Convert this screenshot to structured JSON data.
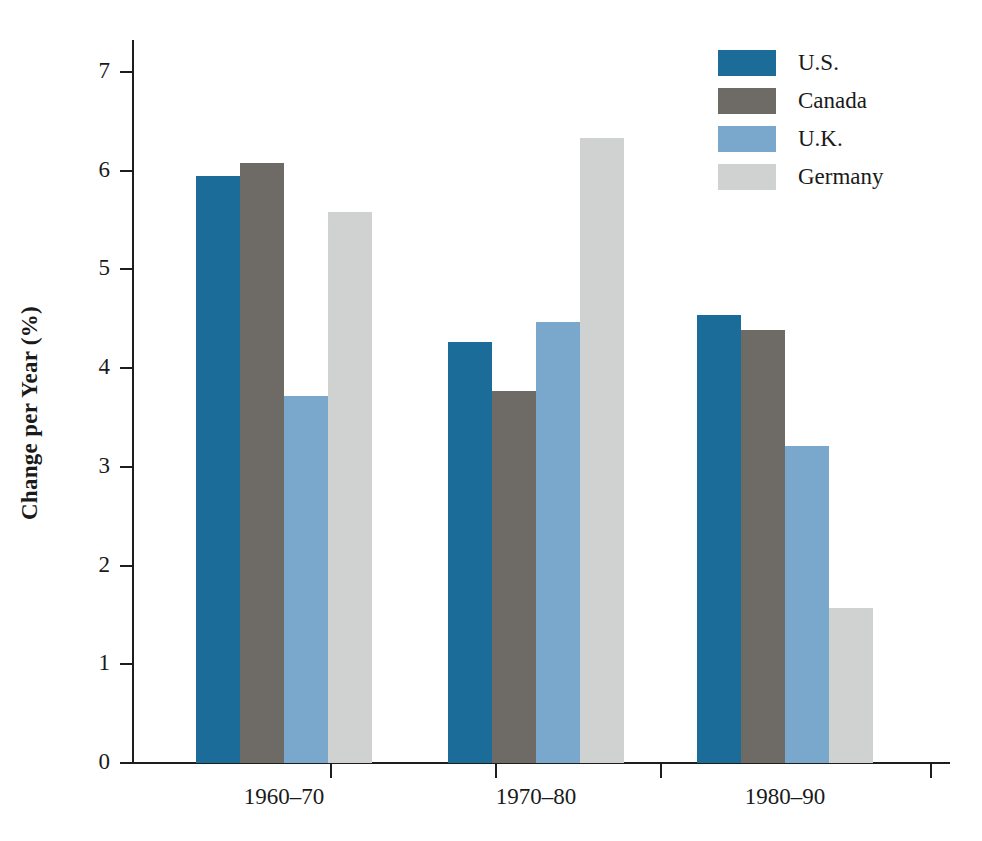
{
  "chart_data": {
    "type": "bar",
    "title": "",
    "xlabel": "",
    "ylabel": "Change per Year (%)",
    "categories": [
      "1960–70",
      "1970–80",
      "1980–90"
    ],
    "series": [
      {
        "name": "U.S.",
        "color": "#1b6c99",
        "values": [
          5.95,
          4.26,
          4.54
        ]
      },
      {
        "name": "Canada",
        "color": "#6e6a66",
        "values": [
          6.08,
          3.77,
          4.39
        ]
      },
      {
        "name": "U.K.",
        "color": "#7aa8cc",
        "values": [
          3.72,
          4.47,
          3.21
        ]
      },
      {
        "name": "Germany",
        "color": "#cfd2d1",
        "values": [
          5.58,
          6.33,
          1.57
        ]
      }
    ],
    "ylim": [
      0,
      7
    ],
    "ytick_labels": [
      "0",
      "1",
      "2",
      "3",
      "4",
      "5",
      "6",
      "7"
    ],
    "ytick_values": [
      0,
      1,
      2,
      3,
      4,
      5,
      6,
      7
    ],
    "grid": false,
    "legend_position": "top-right",
    "annotations": []
  },
  "axes": {
    "y_label": "Change per Year (%)",
    "y_ticks": [
      {
        "label": "7",
        "value": 7
      },
      {
        "label": "6",
        "value": 6
      },
      {
        "label": "5",
        "value": 5
      },
      {
        "label": "4",
        "value": 4
      },
      {
        "label": "3",
        "value": 3
      },
      {
        "label": "2",
        "value": 2
      },
      {
        "label": "1",
        "value": 1
      },
      {
        "label": "0",
        "value": 0
      }
    ],
    "x_ticks": [
      {
        "label": "1960–70"
      },
      {
        "label": "1970–80"
      },
      {
        "label": "1980–90"
      }
    ]
  },
  "legend": {
    "items": [
      {
        "label": "U.S.",
        "color": "#1b6c99"
      },
      {
        "label": "Canada",
        "color": "#6e6a66"
      },
      {
        "label": "U.K.",
        "color": "#7aa8cc"
      },
      {
        "label": "Germany",
        "color": "#cfd2d1"
      }
    ]
  }
}
